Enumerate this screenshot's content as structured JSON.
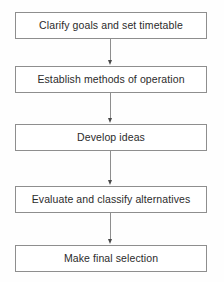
{
  "diagram": {
    "type": "flowchart",
    "orientation": "vertical",
    "title": "",
    "colors": {
      "background": "#fefefe",
      "box_fill": "#ffffff",
      "box_border": "#8e8e8e",
      "connector": "#8e8e8e",
      "arrowhead": "#4a4a4a",
      "text": "#2b2b2b"
    },
    "steps": [
      {
        "id": "step-1",
        "label": "Clarify goals and set timetable"
      },
      {
        "id": "step-2",
        "label": "Establish methods of operation"
      },
      {
        "id": "step-3",
        "label": "Develop ideas"
      },
      {
        "id": "step-4",
        "label": "Evaluate and classify alternatives"
      },
      {
        "id": "step-5",
        "label": "Make final selection"
      }
    ],
    "connectors": [
      {
        "id": "connector-1",
        "from": "step-1",
        "to": "step-2",
        "arrow": "down"
      },
      {
        "id": "connector-2",
        "from": "step-2",
        "to": "step-3",
        "arrow": "down"
      },
      {
        "id": "connector-3",
        "from": "step-3",
        "to": "step-4",
        "arrow": "down"
      },
      {
        "id": "connector-4",
        "from": "step-4",
        "to": "step-5",
        "arrow": "down"
      }
    ]
  }
}
